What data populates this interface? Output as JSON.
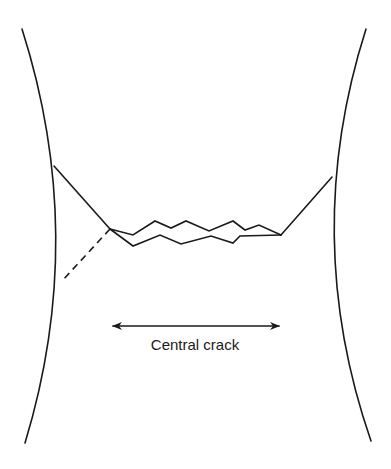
{
  "diagram": {
    "type": "fracture-specimen-schematic",
    "label": "Central crack",
    "colors": {
      "background": "#ffffff",
      "ink": "#1a1a1a"
    },
    "specimen": {
      "left_edge": "M22,29 Q88,236 25,443",
      "right_edge": "M366,29 Q300,236 371,441"
    },
    "shear_lips": {
      "left": "M54,166 L110,229",
      "right": "M281,235 L332,177",
      "left_dashed": "M110,229 L62,281"
    },
    "crack": {
      "upper_zigzag": "M110,229 L133,235 L155,221 L171,228 L186,221 L209,231 L233,221 L245,230 L259,225 L281,235",
      "lower_zigzag": "M110,229 L133,246 L160,235 L181,244 L211,236 L233,243 L240,236 L281,235"
    },
    "dimension_arrow": {
      "x1": 113,
      "y1": 326,
      "x2": 279,
      "y2": 326
    },
    "label_position": {
      "x": 195,
      "y": 350
    }
  }
}
